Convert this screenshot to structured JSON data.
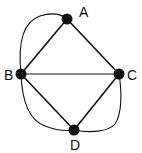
{
  "graph": {
    "nodes": [
      {
        "id": "A",
        "label": "A",
        "x": 67,
        "y": 19,
        "lx": 84,
        "ly": 17
      },
      {
        "id": "B",
        "label": "B",
        "x": 21,
        "y": 74,
        "lx": 5,
        "ly": 80
      },
      {
        "id": "C",
        "label": "C",
        "x": 119,
        "y": 74,
        "lx": 127,
        "ly": 80
      },
      {
        "id": "D",
        "label": "D",
        "x": 74,
        "y": 130,
        "lx": 71,
        "ly": 150
      }
    ],
    "edges": [
      {
        "from": "A",
        "to": "B",
        "type": "straight"
      },
      {
        "from": "A",
        "to": "C",
        "type": "straight"
      },
      {
        "from": "B",
        "to": "C",
        "type": "straight"
      },
      {
        "from": "B",
        "to": "D",
        "type": "straight"
      },
      {
        "from": "C",
        "to": "D",
        "type": "straight"
      },
      {
        "from": "B",
        "to": "A",
        "type": "curved-outer"
      },
      {
        "from": "B",
        "to": "D",
        "type": "curved-outer"
      },
      {
        "from": "D",
        "to": "C",
        "type": "curved-outer"
      }
    ]
  }
}
